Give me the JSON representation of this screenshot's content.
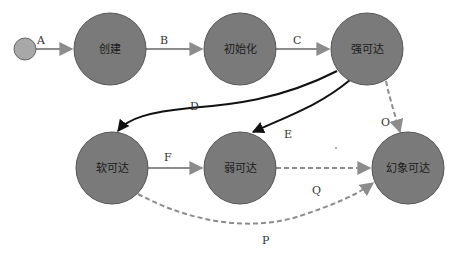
{
  "diagram": {
    "type": "state-diagram",
    "colors": {
      "node_fill": "#7a7a7a",
      "node_stroke": "#555555",
      "start_fill": "#a8a8a8",
      "gray_edge": "#8c8c8c",
      "black_edge": "#111111",
      "dashed_edge": "#8c8c8c"
    },
    "start": {
      "id": "start",
      "cx": 25,
      "cy": 49,
      "r": 11
    },
    "nodes": [
      {
        "id": "created",
        "label": "创建",
        "cx": 110,
        "cy": 49,
        "r": 36
      },
      {
        "id": "init",
        "label": "初始化",
        "cx": 240,
        "cy": 49,
        "r": 36
      },
      {
        "id": "strong",
        "label": "强可达",
        "cx": 367,
        "cy": 49,
        "r": 36
      },
      {
        "id": "soft",
        "label": "软可达",
        "cx": 112,
        "cy": 168,
        "r": 36
      },
      {
        "id": "weak",
        "label": "弱可达",
        "cx": 240,
        "cy": 168,
        "r": 36
      },
      {
        "id": "phantom",
        "label": "幻象可达",
        "cx": 408,
        "cy": 168,
        "r": 36
      }
    ],
    "edges": [
      {
        "id": "A",
        "label": "A",
        "from": "start",
        "to": "created",
        "style": "gray-solid"
      },
      {
        "id": "B",
        "label": "B",
        "from": "created",
        "to": "init",
        "style": "gray-solid"
      },
      {
        "id": "C",
        "label": "C",
        "from": "init",
        "to": "strong",
        "style": "gray-solid"
      },
      {
        "id": "D",
        "label": "D",
        "from": "strong",
        "to": "soft",
        "style": "black-curved"
      },
      {
        "id": "E",
        "label": "E",
        "from": "strong",
        "to": "weak",
        "style": "black-curved"
      },
      {
        "id": "F",
        "label": "F",
        "from": "soft",
        "to": "weak",
        "style": "gray-solid"
      },
      {
        "id": "O",
        "label": "O",
        "from": "strong",
        "to": "phantom",
        "style": "gray-dashed"
      },
      {
        "id": "Q",
        "label": "Q",
        "from": "weak",
        "to": "phantom",
        "style": "gray-dashed"
      },
      {
        "id": "P",
        "label": "P",
        "from": "soft",
        "to": "phantom",
        "style": "gray-dashed-curved"
      }
    ]
  }
}
